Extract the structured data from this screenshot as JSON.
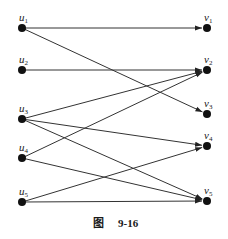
{
  "diagram": {
    "type": "bipartite-directed-graph",
    "left_nodes": [
      {
        "id": "u1",
        "base": "u",
        "sub": "1"
      },
      {
        "id": "u2",
        "base": "u",
        "sub": "2"
      },
      {
        "id": "u3",
        "base": "u",
        "sub": "3"
      },
      {
        "id": "u4",
        "base": "u",
        "sub": "4"
      },
      {
        "id": "u5",
        "base": "u",
        "sub": "5"
      }
    ],
    "right_nodes": [
      {
        "id": "v1",
        "base": "v",
        "sub": "1"
      },
      {
        "id": "v2",
        "base": "v",
        "sub": "2"
      },
      {
        "id": "v3",
        "base": "v",
        "sub": "3"
      },
      {
        "id": "v4",
        "base": "v",
        "sub": "4"
      },
      {
        "id": "v5",
        "base": "v",
        "sub": "5"
      }
    ],
    "edges": [
      {
        "from": "u1",
        "to": "v1"
      },
      {
        "from": "u1",
        "to": "v3"
      },
      {
        "from": "u2",
        "to": "v2"
      },
      {
        "from": "u3",
        "to": "v2"
      },
      {
        "from": "u3",
        "to": "v4"
      },
      {
        "from": "u3",
        "to": "v5"
      },
      {
        "from": "u4",
        "to": "v2"
      },
      {
        "from": "u4",
        "to": "v5"
      },
      {
        "from": "u5",
        "to": "v4"
      },
      {
        "from": "u5",
        "to": "v5"
      }
    ],
    "caption": {
      "prefix": "图",
      "number": "9-16"
    }
  }
}
